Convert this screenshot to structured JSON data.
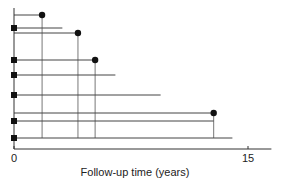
{
  "chart_data": {
    "type": "line",
    "title": "",
    "xlabel": "Follow-up time (years)",
    "ylabel": "",
    "xlim": [
      0,
      16.5
    ],
    "xticks": [
      0,
      15
    ],
    "xtick_labels": [
      "0",
      "15"
    ],
    "grid": false,
    "legend": "none",
    "subjects": [
      {
        "start": 0,
        "end": 1.8,
        "start_marker": "none",
        "end_marker": "circle",
        "drop_line": true
      },
      {
        "start": 0,
        "end": 3.1,
        "start_marker": "square",
        "end_marker": "none",
        "drop_line": false
      },
      {
        "start": 0,
        "end": 4.1,
        "start_marker": "none",
        "end_marker": "circle",
        "drop_line": true
      },
      {
        "start": 0,
        "end": 5.2,
        "start_marker": "square",
        "end_marker": "circle",
        "drop_line": true
      },
      {
        "start": 0,
        "end": 6.5,
        "start_marker": "square",
        "end_marker": "none",
        "drop_line": false
      },
      {
        "start": 0,
        "end": 9.4,
        "start_marker": "square",
        "end_marker": "none",
        "drop_line": false
      },
      {
        "start": 0,
        "end": 12.8,
        "start_marker": "none",
        "end_marker": "circle",
        "drop_line": true
      },
      {
        "start": 0,
        "end": 12.8,
        "start_marker": "square",
        "end_marker": "none",
        "drop_line": false
      },
      {
        "start": 0,
        "end": 14.0,
        "start_marker": "square",
        "end_marker": "none",
        "drop_line": false
      }
    ]
  }
}
